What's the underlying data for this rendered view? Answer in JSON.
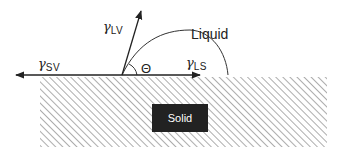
{
  "diagram": {
    "type": "contact-angle-schematic",
    "labels": {
      "gamma_lv": {
        "symbol": "γ",
        "subscript": "LV"
      },
      "gamma_sv": {
        "symbol": "γ",
        "subscript": "SV"
      },
      "gamma_ls": {
        "symbol": "γ",
        "subscript": "LS"
      },
      "theta": "Θ",
      "liquid": "Liquid",
      "solid": "Solid"
    },
    "colors": {
      "line": "#222222",
      "hatch": "#888888",
      "solid_box": "#222222",
      "solid_text": "#ffffff"
    }
  }
}
